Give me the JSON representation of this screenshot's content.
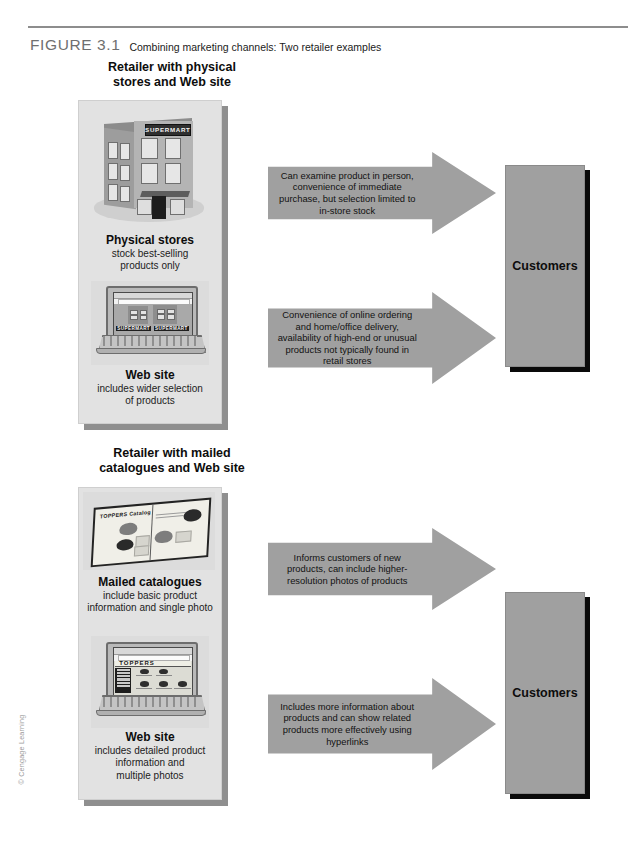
{
  "figure": {
    "number": "FIGURE 3.1",
    "title": "Combining marketing channels: Two retailer examples",
    "copyright": "© Cengage Learning"
  },
  "sections": [
    {
      "heading": "Retailer with physical\nstores and Web site",
      "heading_line1": "Retailer with physical",
      "heading_line2": "stores and Web site",
      "channels": [
        {
          "title": "Physical stores",
          "subtitle_line1": "stock best-selling",
          "subtitle_line2": "products only",
          "artwork": "store-building-illustration",
          "sign_text": "SUPERMART"
        },
        {
          "title": "Web site",
          "subtitle_line1": "includes wider selection",
          "subtitle_line2": "of products",
          "artwork": "laptop-supermart-website-illustration",
          "sign_text": "SUPERMART"
        }
      ],
      "arrows": [
        {
          "text": "Can examine product in person, convenience of immediate purchase, but selection limited to in-store stock"
        },
        {
          "text": "Convenience of online ordering and home/office delivery, availability of high-end or unusual products not typically found in retail stores"
        }
      ],
      "destination": "Customers"
    },
    {
      "heading": "Retailer with mailed\ncatalogues and Web site",
      "heading_line1": "Retailer with mailed",
      "heading_line2": "catalogues and Web site",
      "channels": [
        {
          "title": "Mailed catalogues",
          "subtitle_line1": "include basic product",
          "subtitle_line2": "information and single photo",
          "artwork": "catalogue-illustration",
          "sign_text": "TOPPERS Catalog"
        },
        {
          "title": "Web site",
          "subtitle_line1": "includes detailed product",
          "subtitle_line2": "information and",
          "subtitle_line3": "multiple photos",
          "artwork": "laptop-toppers-website-illustration",
          "sign_text": "TOPPERS"
        }
      ],
      "arrows": [
        {
          "text": "Informs customers of new products, can include higher-resolution photos of products"
        },
        {
          "text": "Includes more information about products and can show related products more effectively using hyperlinks"
        }
      ],
      "destination": "Customers"
    }
  ],
  "colors": {
    "panel_fill": "#e2e2e2",
    "panel_shadow": "#8f8f8f",
    "arrow_fill": "#a0a0a0",
    "arrow_shadow": "#0b0b0b",
    "customers_fill": "#a0a0a0",
    "caption_number": "#6f6f6f",
    "rule": "#8d8d8d"
  }
}
